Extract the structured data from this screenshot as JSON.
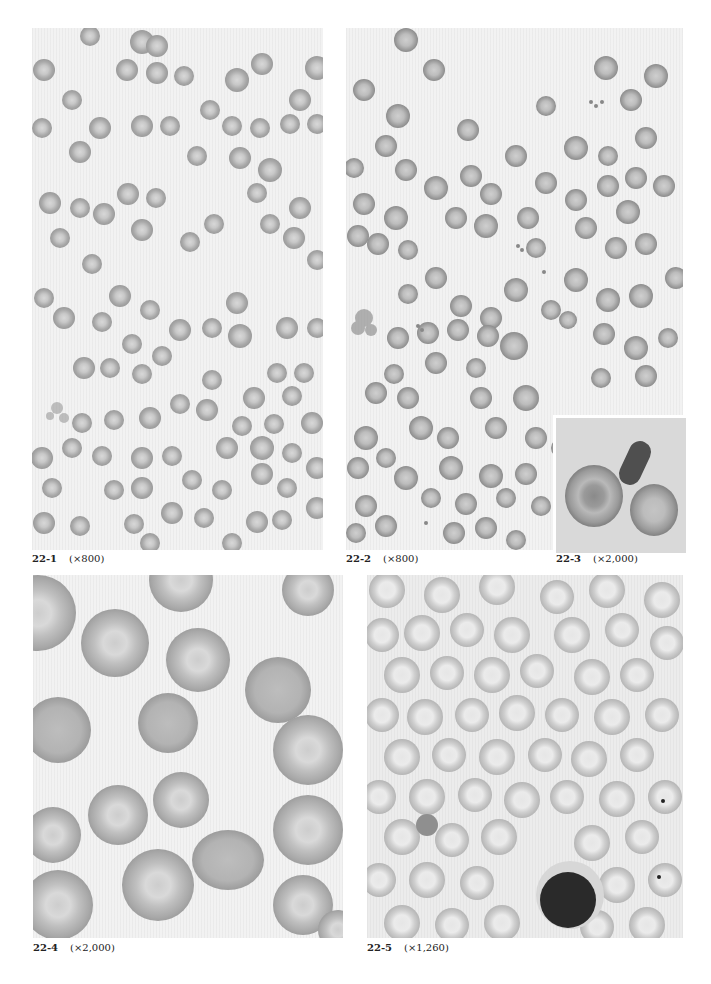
{
  "page": {
    "background": "#ffffff",
    "figures": [
      {
        "id": "22-1",
        "label": "22-1",
        "magnification": "(×800)",
        "description": "Blood smear, many small round erythrocytes with central pallor"
      },
      {
        "id": "22-2",
        "label": "22-2",
        "magnification": "(×800)",
        "description": "Blood smear, erythrocytes with fragments and platelet clusters"
      },
      {
        "id": "22-3",
        "label": "22-3",
        "magnification": "(×2,000)",
        "description": "Inset: two erythrocytes and an elongated dark cell"
      },
      {
        "id": "22-4",
        "label": "22-4",
        "magnification": "(×2,000)",
        "description": "High magnification erythrocytes with target-like pallor"
      },
      {
        "id": "22-5",
        "label": "22-5",
        "magnification": "(×1,260)",
        "description": "Blood smear with pale erythrocytes and a dark lymphocyte"
      }
    ]
  }
}
